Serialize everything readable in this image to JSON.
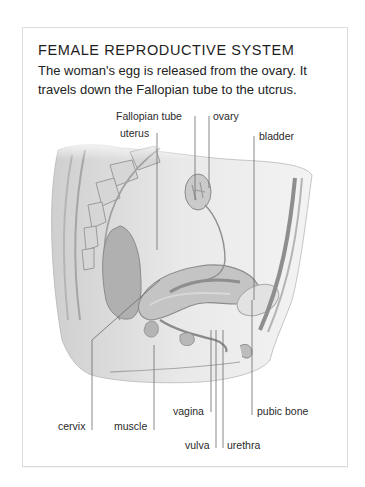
{
  "figure": {
    "title": "FEMALE REPRODUCTIVE SYSTEM",
    "description": "The woman's egg is released from the ovary. It travels down the Fallopian tube to the utcrus."
  },
  "labels": {
    "fallopian_tube": "Fallopian tube",
    "ovary": "ovary",
    "uterus": "uterus",
    "bladder": "bladder",
    "cervix": "cervix",
    "muscle": "muscle",
    "vagina": "vagina",
    "pubic_bone": "pubic bone",
    "vulva": "vulva",
    "urethra": "urethra"
  },
  "colors": {
    "card_border": "#dcdcdc",
    "leader_line": "#6a6a6a",
    "tissue_light": "#e6e6e6",
    "tissue_mid": "#bdbdbd",
    "tissue_dark": "#8f8f8f"
  }
}
